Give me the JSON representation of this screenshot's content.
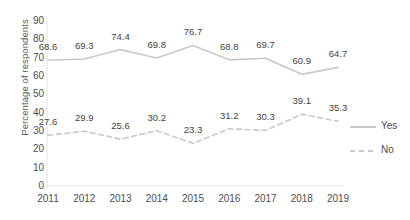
{
  "chart_data": {
    "type": "line",
    "title": "",
    "xlabel": "",
    "ylabel": "Percentage of respondents",
    "ylim": [
      0,
      90
    ],
    "ytick_step": 10,
    "yticks": [
      "90",
      "80",
      "70",
      "60",
      "50",
      "40",
      "30",
      "20",
      "10",
      "0"
    ],
    "grid": false,
    "legend_position": "right",
    "categories": [
      "2011",
      "2012",
      "2013",
      "2014",
      "2015",
      "2016",
      "2017",
      "2018",
      "2019"
    ],
    "series": [
      {
        "name": "Yes",
        "style": "solid",
        "color": "#c9c9cb",
        "values": [
          68.6,
          69.3,
          74.4,
          69.8,
          76.7,
          68.8,
          69.7,
          60.9,
          64.7
        ],
        "labels": [
          "68.6",
          "69.3",
          "74.4",
          "69.8",
          "76.7",
          "68.8",
          "69.7",
          "60.9",
          "64.7"
        ]
      },
      {
        "name": "No",
        "style": "dashed",
        "color": "#c9c9cb",
        "values": [
          27.6,
          29.9,
          25.6,
          30.2,
          23.3,
          31.2,
          30.3,
          39.1,
          35.3
        ],
        "labels": [
          "27.6",
          "29.9",
          "25.6",
          "30.2",
          "23.3",
          "31.2",
          "30.3",
          "39.1",
          "35.3"
        ]
      }
    ]
  },
  "legend": {
    "entries": [
      {
        "label": "Yes"
      },
      {
        "label": "No"
      }
    ]
  }
}
